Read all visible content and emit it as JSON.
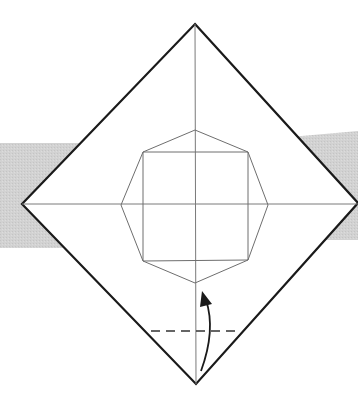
{
  "diagram": {
    "colors": {
      "background": "#ffffff",
      "band": "#d4d4d4",
      "outline": "#1a1a1a",
      "crease": "#7a7a7a",
      "octagon": "#6e6e6e",
      "fold_line": "#333333",
      "arrow": "#1a1a1a"
    },
    "band_left": {
      "points": "0,143 80,143 80,248 0,248"
    },
    "band_right": {
      "points": "290,137 358,131 358,240 290,240"
    },
    "square_outline": {
      "points": "195,24 358,203 196,384 22,204"
    },
    "crease_vertical": {
      "x1": 195,
      "y1": 24,
      "x2": 196,
      "y2": 384
    },
    "crease_horizontal": {
      "x1": 22,
      "y1": 204,
      "x2": 358,
      "y2": 204
    },
    "octagon": {
      "points": "195,130 248,152 268,205 248,260 195,283 143,261 121,205 143,152"
    },
    "inner_square": {
      "points": "143,152 248,152 248,260 143,261"
    },
    "valley_fold_line": {
      "x1": 151,
      "y1": 331,
      "x2": 240,
      "y2": 331,
      "dash": "9,6"
    },
    "fold_arrow": {
      "path": "M201,371 Q216,330 206,300",
      "head": "202,291 212,304 200,307"
    }
  }
}
